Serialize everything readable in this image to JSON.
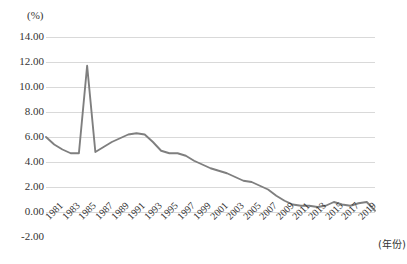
{
  "chart_data": {
    "type": "line",
    "title": "",
    "subtitle": "",
    "xlabel": "(年份)",
    "ylabel": "(%)",
    "ylim": [
      -2.0,
      14.0
    ],
    "ytick_step": 2.0,
    "grid": true,
    "legend": false,
    "legend_position": "none",
    "line_color": "#7f7f7f",
    "gridline_color": "#d9d9d9",
    "text_color": "#333333",
    "x_tick_rotation_deg": -45,
    "y_tick_labels": [
      "14.00",
      "12.00",
      "10.00",
      "8.00",
      "6.00",
      "4.00",
      "2.00",
      "0.00",
      "-2.00"
    ],
    "y_tick_values": [
      14.0,
      12.0,
      10.0,
      8.0,
      6.0,
      4.0,
      2.0,
      0.0,
      -2.0
    ],
    "x_tick_labels": [
      "1981",
      "1983",
      "1985",
      "1987",
      "1989",
      "1991",
      "1993",
      "1995",
      "1997",
      "1999",
      "2001",
      "2003",
      "2005",
      "2007",
      "2009",
      "2011",
      "2013",
      "2015",
      "2017",
      "2019"
    ],
    "x_tick_values": [
      1981,
      1983,
      1985,
      1987,
      1989,
      1991,
      1993,
      1995,
      1997,
      1999,
      2001,
      2003,
      2005,
      2007,
      2009,
      2011,
      2013,
      2015,
      2017,
      2019
    ],
    "xlim": [
      1980,
      2020
    ],
    "x": [
      1980,
      1981,
      1982,
      1983,
      1984,
      1985,
      1986,
      1987,
      1988,
      1989,
      1990,
      1991,
      1992,
      1993,
      1994,
      1995,
      1996,
      1997,
      1998,
      1999,
      2000,
      2001,
      2002,
      2003,
      2004,
      2005,
      2006,
      2007,
      2008,
      2009,
      2010,
      2011,
      2012,
      2013,
      2014,
      2015,
      2016,
      2017,
      2018,
      2019,
      2020
    ],
    "series": [
      {
        "name": "增长率",
        "values": [
          6.0,
          5.4,
          5.0,
          4.7,
          4.7,
          11.7,
          4.8,
          5.2,
          5.6,
          5.9,
          6.2,
          6.3,
          6.2,
          5.6,
          4.9,
          4.7,
          4.7,
          4.5,
          4.1,
          3.8,
          3.5,
          3.3,
          3.1,
          2.8,
          2.5,
          2.4,
          2.1,
          1.8,
          1.3,
          0.9,
          0.6,
          0.5,
          0.5,
          0.4,
          0.5,
          0.8,
          0.6,
          0.5,
          0.7,
          0.8,
          0.1
        ]
      }
    ],
    "annotations": []
  }
}
